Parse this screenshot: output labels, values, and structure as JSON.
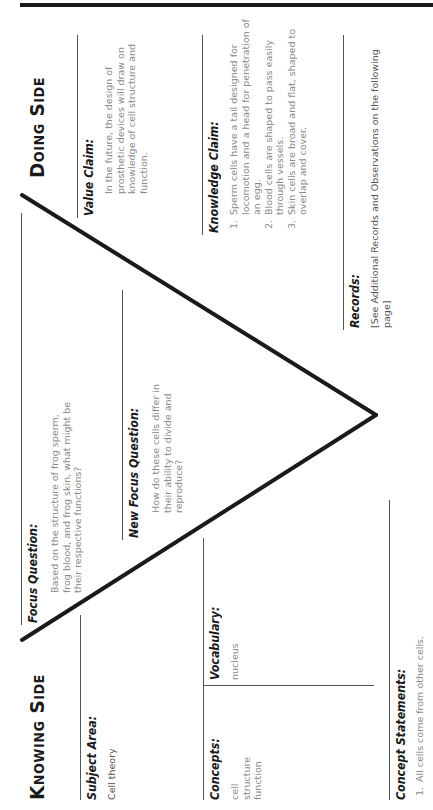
{
  "knowing_side": {
    "title": "Knowing Side",
    "subject_area": {
      "heading": "Subject Area:",
      "text": "Cell theory"
    },
    "concepts": {
      "heading": "Concepts:",
      "items": [
        "cell",
        "structure",
        "function"
      ]
    },
    "vocabulary": {
      "heading": "Vocabulary:",
      "items": [
        "nucleus"
      ]
    },
    "concept_statements": {
      "heading": "Concept Statements:",
      "items": [
        "All cells come from other cells."
      ]
    }
  },
  "center": {
    "focus_question": {
      "heading": "Focus Question:",
      "text": "Based on the structure of frog sperm, frog blood, and frog skin, what might be their respective functions?"
    },
    "new_focus_question": {
      "heading": "New Focus Question:",
      "text": "How do these cells differ in their ability to divide and reproduce?"
    }
  },
  "doing_side": {
    "title": "Doing Side",
    "value_claim": {
      "heading": "Value Claim:",
      "text": "In the future, the design of prosthetic devices will draw on knowledge of cell structure and function."
    },
    "knowledge_claim": {
      "heading": "Knowledge Claim:",
      "items": [
        "Sperm cells have a tail designed for locomotion and a head for penetration of an egg.",
        "Blood cells are shaped to pass easily through vessels.",
        "Skin cells are broad and flat, shaped to overlap and cover."
      ]
    },
    "records": {
      "heading": "Records:",
      "text": "[See Additional Records and Observations on the following page]"
    }
  }
}
